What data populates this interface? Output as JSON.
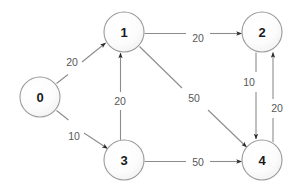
{
  "diagram": {
    "background_color": "#ffffff",
    "node_stroke_color": "#9a9a9a",
    "edge_stroke_color": "#8c8c8c",
    "label_color": "#575757",
    "node_label_color": "#1a1a1a",
    "nodes": [
      {
        "id": "0",
        "label": "0",
        "cx": 40,
        "cy": 97,
        "r": 20
      },
      {
        "id": "1",
        "label": "1",
        "cx": 124,
        "cy": 32,
        "r": 20
      },
      {
        "id": "2",
        "label": "2",
        "cx": 262,
        "cy": 32,
        "r": 20
      },
      {
        "id": "3",
        "label": "3",
        "cx": 124,
        "cy": 160,
        "r": 20
      },
      {
        "id": "4",
        "label": "4",
        "cx": 262,
        "cy": 160,
        "r": 20
      }
    ],
    "edges": [
      {
        "id": "e0-1",
        "from": "0",
        "to": "1",
        "weight": "20",
        "label_x": 72,
        "label_y": 62
      },
      {
        "id": "e0-3",
        "from": "0",
        "to": "3",
        "weight": "10",
        "label_x": 74,
        "label_y": 136
      },
      {
        "id": "e1-2",
        "from": "1",
        "to": "2",
        "weight": "20",
        "label_x": 198,
        "label_y": 38
      },
      {
        "id": "e3-1",
        "from": "3",
        "to": "1",
        "weight": "20",
        "label_x": 120,
        "label_y": 101
      },
      {
        "id": "e1-4",
        "from": "1",
        "to": "4",
        "weight": "50",
        "label_x": 194,
        "label_y": 98
      },
      {
        "id": "e3-4",
        "from": "3",
        "to": "4",
        "weight": "50",
        "label_x": 198,
        "label_y": 162
      },
      {
        "id": "e2-4",
        "from": "2",
        "to": "4",
        "weight": "10",
        "label_x": 249,
        "label_y": 82
      },
      {
        "id": "e4-2",
        "from": "4",
        "to": "2",
        "weight": "20",
        "label_x": 277,
        "label_y": 108
      }
    ]
  }
}
